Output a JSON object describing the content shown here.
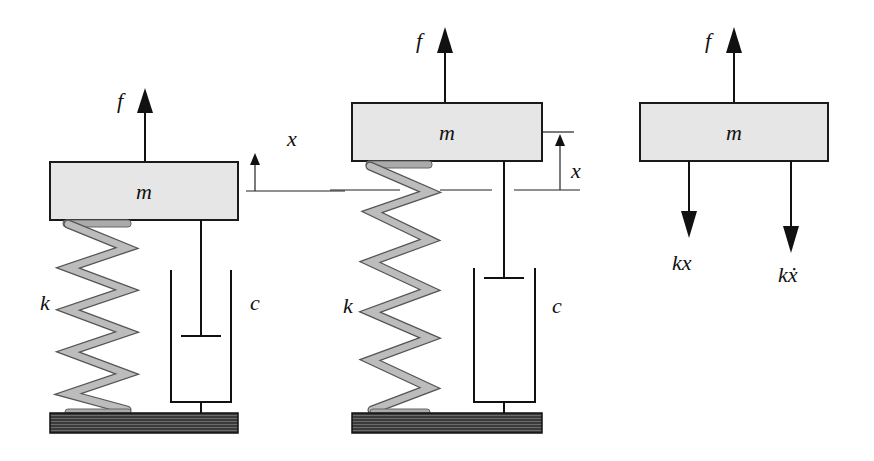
{
  "diagram": {
    "panels": [
      {
        "name": "equilibrium",
        "mass_label": "m",
        "force_label": "f",
        "spring_label": "k",
        "damper_label": "c",
        "displacement_label": "x"
      },
      {
        "name": "displaced",
        "mass_label": "m",
        "force_label": "f",
        "spring_label": "k",
        "damper_label": "c",
        "displacement_label": "x"
      },
      {
        "name": "free-body",
        "mass_label": "m",
        "force_label": "f",
        "spring_force_label": "kx",
        "damper_force_label": "kẋ"
      }
    ],
    "colors": {
      "mass_fill": "#e6e6e6",
      "spring": "#bcbcbc",
      "ground": "#444444",
      "ink": "#111111"
    }
  }
}
